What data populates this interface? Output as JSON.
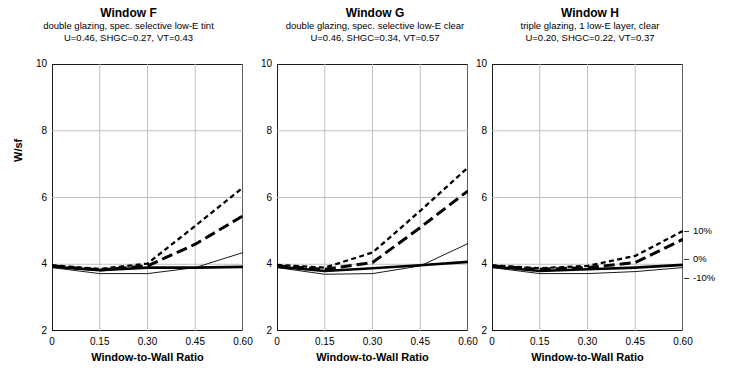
{
  "axes": {
    "ylabel": "W/sf",
    "xlabel": "Window-to-Wall Ratio",
    "yticks": [
      "2",
      "4",
      "6",
      "8",
      "10"
    ],
    "xticks": [
      "0",
      "0.15",
      "0.30",
      "0.45",
      "0.60"
    ],
    "ylim": [
      2,
      10
    ],
    "xlim": [
      0,
      0.6
    ]
  },
  "legend": {
    "items": [
      "10%",
      "0%",
      "-10%"
    ],
    "values": [
      5.0,
      4.15,
      3.6
    ]
  },
  "panels": [
    {
      "id": "window-f",
      "title": "Window F",
      "subtitle1": "double glazing, spec. selective low-E tint",
      "subtitle2": "U=0.46, SHGC=0.27, VT=0.43"
    },
    {
      "id": "window-g",
      "title": "Window G",
      "subtitle1": "double glazing, spec. selective low-E clear",
      "subtitle2": "U=0.46, SHGC=0.34, VT=0.57"
    },
    {
      "id": "window-h",
      "title": "Window H",
      "subtitle1": "triple glazing, 1 low-E layer, clear",
      "subtitle2": "U=0.20, SHGC=0.22, VT=0.37"
    }
  ],
  "chart_data": {
    "type": "line",
    "xlabel": "Window-to-Wall Ratio",
    "ylabel": "W/sf",
    "xlim": [
      0,
      0.6
    ],
    "ylim": [
      2,
      10
    ],
    "grid": "vertical and horizontal gridlines at ticks",
    "legend_position": "right of third panel",
    "x": [
      0,
      0.15,
      0.3,
      0.45,
      0.6
    ],
    "panels": [
      {
        "name": "Window F",
        "subtitle": "double glazing, spec. selective low-E tint",
        "U": 0.46,
        "SHGC": 0.27,
        "VT": 0.43,
        "series": [
          {
            "name": "short-dash",
            "style": "short-dash",
            "values": [
              3.97,
              3.86,
              4.02,
              5.15,
              6.3
            ]
          },
          {
            "name": "long-dash",
            "style": "long-dash",
            "values": [
              3.95,
              3.83,
              3.95,
              4.6,
              5.45
            ]
          },
          {
            "name": "thick-solid",
            "style": "thick-solid",
            "values": [
              3.93,
              3.82,
              3.9,
              3.9,
              3.92
            ]
          },
          {
            "name": "thin-solid",
            "style": "thin-solid",
            "values": [
              3.9,
              3.72,
              3.72,
              3.9,
              4.35
            ]
          }
        ]
      },
      {
        "name": "Window G",
        "subtitle": "double glazing, spec. selective low-E clear",
        "U": 0.46,
        "SHGC": 0.34,
        "VT": 0.57,
        "series": [
          {
            "name": "short-dash",
            "style": "short-dash",
            "values": [
              3.98,
              3.9,
              4.35,
              5.6,
              6.9
            ]
          },
          {
            "name": "long-dash",
            "style": "long-dash",
            "values": [
              3.95,
              3.85,
              4.05,
              5.1,
              6.2
            ]
          },
          {
            "name": "thick-solid",
            "style": "thick-solid",
            "values": [
              3.93,
              3.8,
              3.88,
              3.97,
              4.07
            ]
          },
          {
            "name": "thin-solid",
            "style": "thin-solid",
            "values": [
              3.9,
              3.7,
              3.72,
              3.95,
              4.62
            ]
          }
        ]
      },
      {
        "name": "Window H",
        "subtitle": "triple glazing, 1 low-E layer, clear",
        "U": 0.2,
        "SHGC": 0.22,
        "VT": 0.37,
        "series": [
          {
            "name": "short-dash",
            "style": "short-dash",
            "values": [
              3.97,
              3.88,
              3.95,
              4.25,
              5.0
            ]
          },
          {
            "name": "long-dash",
            "style": "long-dash",
            "values": [
              3.95,
              3.85,
              3.9,
              4.05,
              4.75
            ]
          },
          {
            "name": "thick-solid",
            "style": "thick-solid",
            "values": [
              3.93,
              3.8,
              3.85,
              3.9,
              3.98
            ]
          },
          {
            "name": "thin-solid",
            "style": "thin-solid",
            "values": [
              3.9,
              3.72,
              3.72,
              3.78,
              3.9
            ]
          }
        ]
      }
    ]
  }
}
